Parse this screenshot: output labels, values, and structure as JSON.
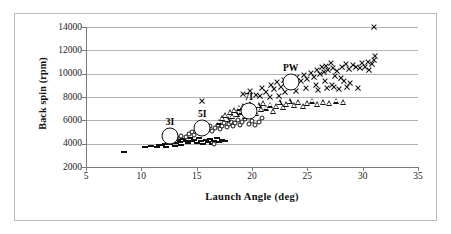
{
  "chart_data": {
    "type": "scatter",
    "title": "",
    "xlabel": "Launch Angle (deg)",
    "ylabel": "Back spin (rpm)",
    "xlim": [
      5,
      35
    ],
    "ylim": [
      2000,
      14000
    ],
    "xticks": [
      5,
      10,
      15,
      20,
      25,
      30,
      35
    ],
    "yticks": [
      2000,
      4000,
      6000,
      8000,
      10000,
      12000,
      14000
    ],
    "grid": true,
    "legend": "none",
    "annotations": [
      {
        "label": "3I",
        "x": 12.6,
        "y": 4650
      },
      {
        "label": "5I",
        "x": 15.5,
        "y": 5350
      },
      {
        "label": "7I",
        "x": 19.7,
        "y": 6800
      },
      {
        "label": "PW",
        "x": 23.5,
        "y": 9250
      }
    ],
    "series": [
      {
        "name": "3I",
        "marker": "dash",
        "points": [
          [
            8.4,
            3300
          ],
          [
            10.3,
            3750
          ],
          [
            10.9,
            3800
          ],
          [
            11.4,
            3700
          ],
          [
            11.6,
            3900
          ],
          [
            11.9,
            3850
          ],
          [
            12.1,
            4000
          ],
          [
            12.2,
            3750
          ],
          [
            12.4,
            4100
          ],
          [
            12.6,
            3950
          ],
          [
            12.8,
            4200
          ],
          [
            13.0,
            3800
          ],
          [
            13.1,
            4050
          ],
          [
            13.3,
            4300
          ],
          [
            13.5,
            4150
          ],
          [
            13.6,
            3900
          ],
          [
            13.8,
            4400
          ],
          [
            14.0,
            4250
          ],
          [
            14.2,
            4050
          ],
          [
            14.4,
            4500
          ],
          [
            14.6,
            4200
          ],
          [
            14.8,
            4350
          ],
          [
            15.0,
            4100
          ],
          [
            15.2,
            4450
          ],
          [
            15.4,
            4250
          ],
          [
            15.6,
            3950
          ],
          [
            15.8,
            4300
          ],
          [
            16.0,
            4150
          ],
          [
            16.2,
            4400
          ],
          [
            16.4,
            4000
          ],
          [
            16.6,
            4250
          ],
          [
            16.8,
            4500
          ],
          [
            17.0,
            4150
          ],
          [
            17.3,
            4350
          ],
          [
            17.6,
            4200
          ]
        ]
      },
      {
        "name": "5I",
        "marker": "circle",
        "points": [
          [
            13.2,
            4500
          ],
          [
            13.6,
            4700
          ],
          [
            14.0,
            4600
          ],
          [
            14.3,
            4850
          ],
          [
            14.6,
            5000
          ],
          [
            14.8,
            4750
          ],
          [
            15.0,
            5150
          ],
          [
            15.2,
            4950
          ],
          [
            15.4,
            5300
          ],
          [
            15.6,
            5100
          ],
          [
            15.8,
            5400
          ],
          [
            16.0,
            5200
          ],
          [
            16.2,
            5500
          ],
          [
            16.4,
            5050
          ],
          [
            16.6,
            4000
          ],
          [
            16.7,
            5350
          ],
          [
            16.9,
            5600
          ],
          [
            17.1,
            5250
          ],
          [
            17.3,
            5500
          ],
          [
            17.5,
            5800
          ],
          [
            17.7,
            5400
          ],
          [
            17.9,
            5650
          ],
          [
            18.1,
            5900
          ],
          [
            18.3,
            5500
          ],
          [
            18.5,
            5750
          ],
          [
            18.7,
            6000
          ],
          [
            18.9,
            5600
          ],
          [
            19.1,
            5850
          ],
          [
            19.4,
            6100
          ],
          [
            19.7,
            5700
          ],
          [
            20.0,
            5950
          ],
          [
            20.3,
            5600
          ],
          [
            20.6,
            5850
          ],
          [
            20.9,
            6200
          ]
        ]
      },
      {
        "name": "7I",
        "marker": "triangle",
        "points": [
          [
            17.0,
            5900
          ],
          [
            17.3,
            6200
          ],
          [
            17.6,
            6450
          ],
          [
            17.8,
            6100
          ],
          [
            18.0,
            6700
          ],
          [
            18.2,
            6350
          ],
          [
            18.4,
            6900
          ],
          [
            18.6,
            6550
          ],
          [
            18.8,
            7100
          ],
          [
            19.0,
            6750
          ],
          [
            19.2,
            7250
          ],
          [
            19.4,
            6400
          ],
          [
            19.6,
            7000
          ],
          [
            19.8,
            7400
          ],
          [
            20.0,
            6850
          ],
          [
            20.2,
            7150
          ],
          [
            20.4,
            6600
          ],
          [
            20.6,
            7300
          ],
          [
            20.8,
            6950
          ],
          [
            21.0,
            7500
          ],
          [
            21.3,
            7100
          ],
          [
            21.6,
            7350
          ],
          [
            21.9,
            6800
          ],
          [
            22.2,
            7200
          ],
          [
            22.5,
            7550
          ],
          [
            22.8,
            7150
          ],
          [
            23.1,
            7400
          ],
          [
            23.4,
            7650
          ],
          [
            23.8,
            7300
          ],
          [
            24.2,
            7550
          ],
          [
            24.6,
            7250
          ],
          [
            25.0,
            7500
          ],
          [
            25.4,
            7700
          ],
          [
            25.9,
            7400
          ],
          [
            26.4,
            7600
          ],
          [
            27.0,
            7450
          ],
          [
            27.6,
            7700
          ],
          [
            28.2,
            7550
          ]
        ]
      },
      {
        "name": "PW",
        "marker": "x",
        "points": [
          [
            15.5,
            7700
          ],
          [
            19.2,
            8300
          ],
          [
            19.8,
            8550
          ],
          [
            20.4,
            8200
          ],
          [
            20.9,
            8800
          ],
          [
            21.3,
            8450
          ],
          [
            21.7,
            9050
          ],
          [
            22.0,
            8700
          ],
          [
            22.3,
            9250
          ],
          [
            22.6,
            8900
          ],
          [
            22.9,
            9450
          ],
          [
            23.2,
            9100
          ],
          [
            23.5,
            9600
          ],
          [
            23.8,
            9300
          ],
          [
            24.1,
            9750
          ],
          [
            24.4,
            9400
          ],
          [
            24.7,
            9900
          ],
          [
            25.0,
            9550
          ],
          [
            25.3,
            10050
          ],
          [
            25.6,
            9700
          ],
          [
            25.9,
            10300
          ],
          [
            26.1,
            9950
          ],
          [
            26.3,
            10550
          ],
          [
            26.5,
            10150
          ],
          [
            26.7,
            10700
          ],
          [
            26.9,
            10350
          ],
          [
            27.1,
            10900
          ],
          [
            27.3,
            10500
          ],
          [
            27.5,
            9800
          ],
          [
            27.7,
            10250
          ],
          [
            27.9,
            8700
          ],
          [
            28.1,
            10600
          ],
          [
            28.3,
            9400
          ],
          [
            28.5,
            10850
          ],
          [
            28.8,
            10400
          ],
          [
            29.1,
            10750
          ],
          [
            29.4,
            10550
          ],
          [
            29.6,
            8800
          ],
          [
            29.9,
            10900
          ],
          [
            30.2,
            10600
          ],
          [
            30.5,
            11000
          ],
          [
            30.8,
            10800
          ],
          [
            31.0,
            11200
          ],
          [
            31.1,
            11500
          ],
          [
            31.0,
            14000
          ],
          [
            30.6,
            10300
          ],
          [
            29.8,
            10450
          ],
          [
            28.9,
            9200
          ],
          [
            28.0,
            9600
          ],
          [
            27.2,
            9000
          ],
          [
            26.6,
            9350
          ],
          [
            25.8,
            9000
          ],
          [
            24.9,
            8750
          ],
          [
            24.0,
            8500
          ],
          [
            23.0,
            8400
          ],
          [
            22.4,
            8100
          ],
          [
            21.6,
            8000
          ],
          [
            20.7,
            8100
          ],
          [
            26.0,
            8600
          ],
          [
            27.4,
            8900
          ],
          [
            28.6,
            8900
          ],
          [
            26.8,
            8800
          ]
        ]
      }
    ]
  },
  "axes": {
    "y_tick_labels": [
      "14000",
      "12000",
      "10000",
      "8000",
      "6000",
      "4000",
      "2000"
    ],
    "x_tick_labels": [
      "5",
      "10",
      "15",
      "20",
      "25",
      "30",
      "35"
    ],
    "x_title": "Launch Angle (deg)",
    "y_title": "Back spin (rpm)"
  },
  "colors": {
    "marker": "#111111",
    "gridline": "#b3b3b3",
    "axis": "#7a7a7a",
    "border": "#b9b9b9",
    "background": "#ffffff"
  }
}
